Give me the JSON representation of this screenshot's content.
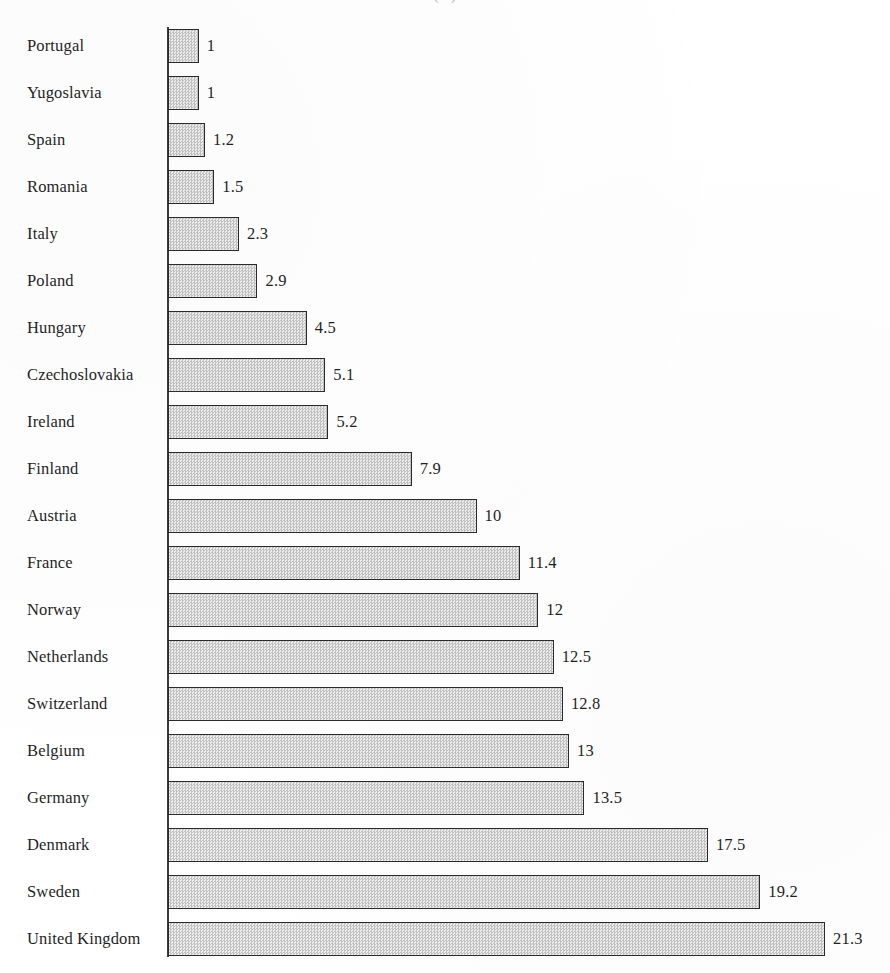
{
  "chart_data": {
    "type": "bar",
    "orientation": "horizontal",
    "title": "(...)",
    "title_visibility": "cropped-at-top-edge",
    "xlabel": "",
    "ylabel": "",
    "grid": false,
    "legend": null,
    "axis": {
      "category_axis": "vertical-left",
      "value_axis_visible": false,
      "xlim": [
        0,
        21.3
      ]
    },
    "categories": [
      "Portugal",
      "Yugoslavia",
      "Spain",
      "Romania",
      "Italy",
      "Poland",
      "Hungary",
      "Czechoslovakia",
      "Ireland",
      "Finland",
      "Austria",
      "France",
      "Norway",
      "Netherlands",
      "Switzerland",
      "Belgium",
      "Germany",
      "Denmark",
      "Sweden",
      "United Kingdom"
    ],
    "values": [
      1,
      1,
      1.2,
      1.5,
      2.3,
      2.9,
      4.5,
      5.1,
      5.2,
      7.9,
      10,
      11.4,
      12,
      12.5,
      12.8,
      13,
      13.5,
      17.5,
      19.2,
      21.3
    ],
    "value_labels": [
      "1",
      "1",
      "1.2",
      "1.5",
      "2.3",
      "2.9",
      "4.5",
      "5.1",
      "5.2",
      "7.9",
      "10",
      "11.4",
      "12",
      "12.5",
      "12.8",
      "13",
      "13.5",
      "17.5",
      "19.2",
      "21.3"
    ],
    "colors": {
      "bar_fill": "#e3e3e3",
      "bar_pattern": "#c2c2c2",
      "bar_border": "#2b2b2b",
      "axis": "#3a3a3a",
      "text": "#1f1f1f",
      "background": "#ffffff"
    }
  },
  "layout": {
    "baseline_x": 168,
    "px_per_unit": 30.85,
    "row_pitch": 47,
    "bar_height": 34,
    "first_bar_top": 29,
    "value_label_gap": 8
  }
}
